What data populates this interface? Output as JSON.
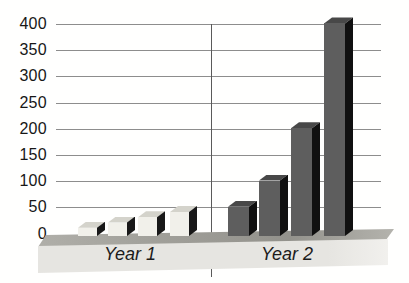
{
  "chart_data": {
    "type": "bar",
    "style": "3d-perspective",
    "title": "",
    "xlabel": "",
    "ylabel": "",
    "groups": [
      {
        "label": "Year 1",
        "values": [
          10,
          20,
          30,
          40
        ]
      },
      {
        "label": "Year 2",
        "values": [
          50,
          100,
          200,
          400
        ]
      }
    ],
    "yticks": [
      0,
      50,
      100,
      150,
      200,
      250,
      300,
      350,
      400
    ],
    "ylim": [
      0,
      400
    ],
    "grid": true,
    "legend_position": "none",
    "colors": {
      "year1_front": "#f1f0ea",
      "year1_top": "#d4d3cb",
      "year1_side": "#181818",
      "year2_front": "#5e5e5e",
      "year2_top": "#484848",
      "year2_side": "#101010",
      "floor_top": "#a09f99",
      "floor_front": "#e6e5e1",
      "gridline": "#8d8d8d",
      "divider": "#5a5a5a",
      "text": "#171717"
    }
  }
}
